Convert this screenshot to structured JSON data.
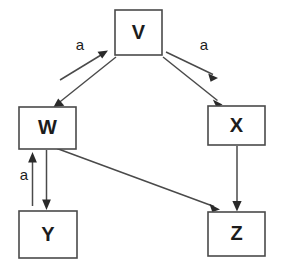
{
  "diagram": {
    "type": "directed-graph",
    "background_color": "#ffffff",
    "node_stroke_color": "#4a4a4a",
    "edge_color": "#4a4a4a",
    "arrow_color": "#2a2a2a",
    "text_color": "#1c1c1c",
    "nodes": [
      {
        "id": "V",
        "label": "V",
        "x": 115,
        "y": 10,
        "w": 47,
        "h": 45,
        "cx": 138.5,
        "cy": 32.5
      },
      {
        "id": "W",
        "label": "W",
        "x": 19,
        "y": 107,
        "w": 57,
        "h": 42,
        "cx": 47.5,
        "cy": 128
      },
      {
        "id": "X",
        "label": "X",
        "x": 208,
        "y": 106,
        "w": 57,
        "h": 39,
        "cx": 236.5,
        "cy": 125.5
      },
      {
        "id": "Y",
        "label": "Y",
        "x": 19,
        "y": 211,
        "w": 58,
        "h": 47,
        "cx": 48,
        "cy": 234.5
      },
      {
        "id": "Z",
        "label": "Z",
        "x": 208,
        "y": 212,
        "w": 57,
        "h": 44,
        "cx": 236.5,
        "cy": 234
      }
    ],
    "edges": [
      {
        "id": "w-to-v",
        "from": "W",
        "to": "V",
        "label": "a",
        "label_x": 80,
        "label_y": 46
      },
      {
        "id": "v-to-w",
        "from": "V",
        "to": "W",
        "label": "",
        "label_x": 0,
        "label_y": 0
      },
      {
        "id": "v-to-x-labeled",
        "from": "V",
        "to": "X",
        "label": "a",
        "label_x": 204,
        "label_y": 46
      },
      {
        "id": "v-to-x",
        "from": "V",
        "to": "X",
        "label": "",
        "label_x": 0,
        "label_y": 0
      },
      {
        "id": "y-to-w",
        "from": "Y",
        "to": "W",
        "label": "a",
        "label_x": 24,
        "label_y": 176
      },
      {
        "id": "w-to-y",
        "from": "W",
        "to": "Y",
        "label": "",
        "label_x": 0,
        "label_y": 0
      },
      {
        "id": "w-to-z",
        "from": "W",
        "to": "Z",
        "label": "",
        "label_x": 0,
        "label_y": 0
      },
      {
        "id": "x-to-z",
        "from": "X",
        "to": "Z",
        "label": "",
        "label_x": 0,
        "label_y": 0
      }
    ],
    "edge_labels": {
      "w_to_v": "a",
      "v_to_x": "a",
      "y_to_w": "a"
    }
  }
}
